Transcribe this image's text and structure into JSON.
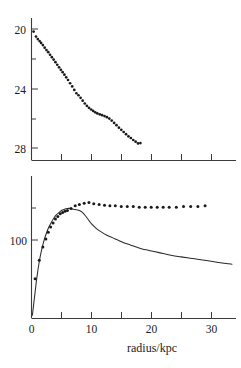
{
  "figure": {
    "title": "",
    "xlabel": "radius/kpc",
    "background": "#ffffff",
    "ink_color": "#1a1a1a"
  },
  "chart_data": [
    {
      "type": "scatter",
      "panel": "top",
      "title": "",
      "xlabel": "",
      "ylabel": "",
      "xlim": [
        0,
        34
      ],
      "ylim": [
        29.2,
        19.2
      ],
      "y_inverted": true,
      "grid": false,
      "legend": null,
      "xticks": [
        5,
        10,
        15,
        20,
        25,
        30
      ],
      "xticklabels": [
        "",
        "",
        "",
        "",
        "",
        ""
      ],
      "yticks": [
        20,
        22,
        24,
        26,
        28
      ],
      "yticklabels": [
        "20",
        "",
        "24",
        "",
        "28"
      ],
      "series": [
        {
          "name": "surface brightness",
          "marker": "point",
          "x": [
            0.35,
            0.75,
            1.05,
            1.35,
            1.6,
            1.9,
            2.2,
            2.5,
            2.8,
            3.1,
            3.4,
            3.7,
            4.0,
            4.3,
            4.6,
            4.9,
            5.2,
            5.5,
            5.8,
            6.1,
            6.45,
            6.8,
            7.15,
            7.5,
            7.85,
            8.2,
            8.55,
            8.9,
            9.25,
            9.6,
            9.95,
            10.3,
            10.65,
            11.0,
            11.4,
            11.8,
            12.2,
            12.6,
            13.0,
            13.4,
            13.8,
            14.2,
            14.6,
            15.0,
            15.4,
            15.8,
            16.2,
            16.6,
            17.0,
            17.4,
            17.8,
            18.2
          ],
          "y": [
            20.15,
            20.5,
            20.68,
            20.82,
            20.95,
            21.1,
            21.28,
            21.45,
            21.6,
            21.78,
            21.95,
            22.12,
            22.3,
            22.48,
            22.66,
            22.84,
            23.0,
            23.18,
            23.36,
            23.55,
            23.78,
            24.0,
            24.25,
            24.48,
            24.62,
            24.8,
            25.0,
            25.2,
            25.36,
            25.5,
            25.62,
            25.72,
            25.82,
            25.9,
            25.96,
            26.02,
            26.08,
            26.16,
            26.26,
            26.4,
            26.56,
            26.72,
            26.9,
            27.05,
            27.2,
            27.35,
            27.5,
            27.62,
            27.76,
            27.88,
            28.0,
            27.98
          ]
        }
      ]
    },
    {
      "type": "line",
      "panel": "bottom",
      "title": "",
      "xlabel": "radius/kpc",
      "ylabel": "",
      "xlim": [
        0,
        34
      ],
      "ylim": [
        0,
        215
      ],
      "grid": false,
      "legend": null,
      "xticks": [
        0,
        5,
        10,
        15,
        20,
        25,
        30
      ],
      "xticklabels": [
        "0",
        "",
        "10",
        "",
        "20",
        "",
        "30"
      ],
      "yticks": [
        100,
        150
      ],
      "yticklabels": [
        "100",
        ""
      ],
      "series": [
        {
          "name": "observed rotation velocity",
          "marker": "point",
          "style": "scatter",
          "x": [
            0.6,
            1.3,
            1.9,
            2.4,
            2.8,
            3.2,
            3.6,
            4.0,
            4.4,
            4.8,
            5.2,
            5.6,
            6.0,
            6.6,
            7.3,
            8.0,
            8.8,
            9.6,
            10.4,
            11.3,
            12.2,
            13.1,
            14.0,
            15.0,
            16.0,
            17.0,
            18.0,
            19.0,
            20.0,
            21.0,
            22.0,
            23.0,
            24.2,
            25.4,
            26.6,
            27.8,
            29.0
          ],
          "y": [
            60,
            88,
            108,
            120,
            130,
            138,
            144,
            150,
            154,
            158,
            160,
            162,
            163,
            166,
            170,
            172,
            174,
            175,
            173,
            172,
            171,
            170,
            170,
            169,
            169,
            169,
            168,
            168,
            168,
            168,
            168,
            168,
            168,
            169,
            169,
            169,
            170
          ]
        },
        {
          "name": "model rotation curve",
          "marker": "none",
          "style": "line",
          "x": [
            0.15,
            0.5,
            0.9,
            1.3,
            1.7,
            2.1,
            2.5,
            2.9,
            3.3,
            3.7,
            4.1,
            4.5,
            5.0,
            5.5,
            6.0,
            6.5,
            7.0,
            7.5,
            8.0,
            8.5,
            9.0,
            9.5,
            10.0,
            10.8,
            11.6,
            12.5,
            13.5,
            14.5,
            15.5,
            16.5,
            17.5,
            18.5,
            19.5,
            20.5,
            22.0,
            23.5,
            25.0,
            26.5,
            28.0,
            29.5,
            31.0,
            32.5,
            33.5
          ],
          "y": [
            5,
            32,
            62,
            86,
            104,
            118,
            129,
            138,
            145,
            151,
            156,
            159,
            163,
            165,
            166,
            166,
            165,
            164,
            163,
            160,
            155,
            149,
            143,
            136,
            131,
            126,
            122,
            118,
            114,
            111,
            108,
            105,
            103,
            101,
            98,
            95,
            93,
            91,
            89,
            87,
            85,
            83,
            82
          ]
        }
      ]
    }
  ]
}
